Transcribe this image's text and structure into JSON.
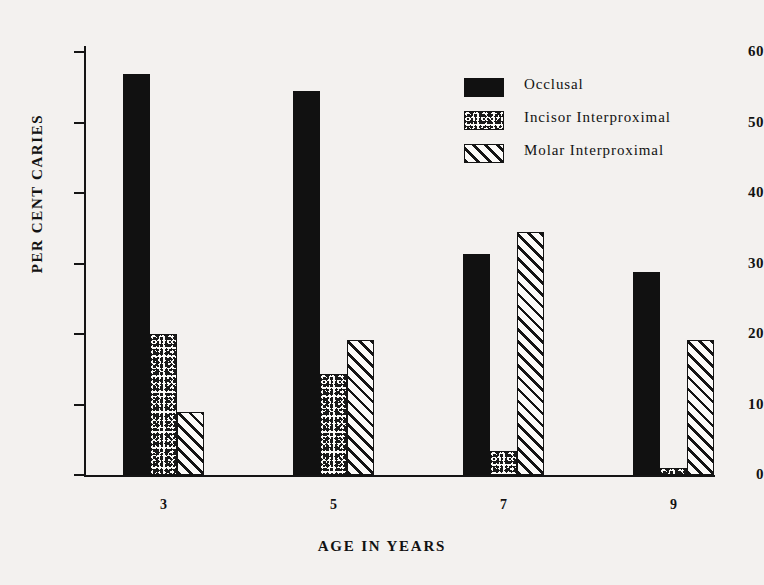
{
  "chart_data": {
    "type": "bar",
    "title": "",
    "xlabel": "AGE IN YEARS",
    "ylabel": "PER CENT CARIES",
    "categories": [
      "3",
      "5",
      "7",
      "9"
    ],
    "ylim": [
      0,
      60
    ],
    "yticks": [
      0,
      10,
      20,
      30,
      40,
      50,
      60
    ],
    "ytick_labels": [
      "0",
      "10",
      "20",
      "30",
      "40",
      "50",
      "60"
    ],
    "grid": false,
    "legend_position": "upper right",
    "series": [
      {
        "name": "Occlusal",
        "fill": "solid",
        "color": "#111111",
        "values": [
          56.9,
          54.4,
          31.4,
          28.8
        ]
      },
      {
        "name": "Incisor Interproximal",
        "fill": "stipple",
        "color": "#141414",
        "values": [
          20.0,
          14.3,
          3.4,
          1.0
        ]
      },
      {
        "name": "Molar Interproximal",
        "fill": "hatch",
        "color": "#141414",
        "values": [
          9.0,
          19.2,
          34.4,
          19.2
        ]
      }
    ]
  },
  "style": {
    "background": "#f3f1ef",
    "ink": "#121212"
  }
}
